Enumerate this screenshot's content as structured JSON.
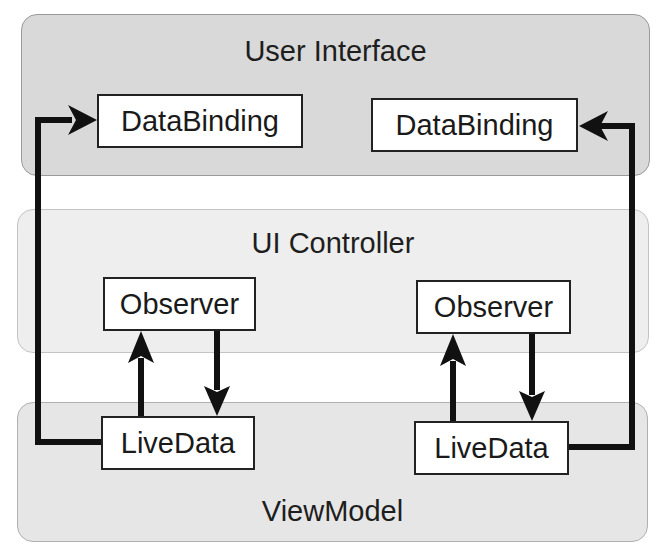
{
  "diagram": {
    "layers": [
      {
        "id": "ui",
        "title": "User Interface"
      },
      {
        "id": "controller",
        "title": "UI Controller"
      },
      {
        "id": "viewmodel",
        "title": "ViewModel"
      }
    ],
    "components": {
      "databinding_left": "DataBinding",
      "databinding_right": "DataBinding",
      "observer_left": "Observer",
      "observer_right": "Observer",
      "livedata_left": "LiveData",
      "livedata_right": "LiveData"
    },
    "connections": [
      {
        "from": "livedata_left",
        "to": "databinding_left",
        "style": "arrow"
      },
      {
        "from": "livedata_left",
        "to": "observer_left",
        "style": "arrow"
      },
      {
        "from": "observer_left",
        "to": "livedata_left",
        "style": "arrow"
      },
      {
        "from": "livedata_right",
        "to": "databinding_right",
        "style": "arrow"
      },
      {
        "from": "livedata_right",
        "to": "observer_right",
        "style": "arrow"
      },
      {
        "from": "observer_right",
        "to": "livedata_right",
        "style": "arrow"
      }
    ],
    "colors": {
      "ui_layer": "#d9d9d9",
      "controller_layer": "#eeeeee",
      "viewmodel_layer": "#e6e6e6",
      "line": "#111111"
    }
  }
}
